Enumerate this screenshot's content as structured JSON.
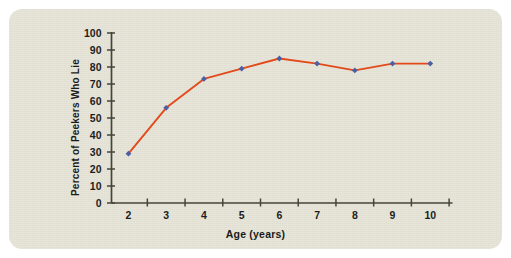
{
  "figure": {
    "background_color": "#e7e5d8",
    "page_color": "#ffffff"
  },
  "chart_data": {
    "type": "line",
    "title": "",
    "xlabel": "Age (years)",
    "ylabel": "Percent of Peekers Who Lie",
    "x": [
      2,
      3,
      4,
      5,
      6,
      7,
      8,
      9,
      10
    ],
    "values": [
      29,
      56,
      73,
      79,
      85,
      82,
      78,
      82,
      82
    ],
    "categories": [
      "2",
      "3",
      "4",
      "5",
      "6",
      "7",
      "8",
      "9",
      "10"
    ],
    "xlim": [
      1.55,
      10.55
    ],
    "ylim": [
      0,
      100
    ],
    "y_ticks": [
      0,
      10,
      20,
      30,
      40,
      50,
      60,
      70,
      80,
      90,
      100
    ],
    "y_tick_labels": [
      "0",
      "10",
      "20",
      "30",
      "40",
      "50",
      "60",
      "70",
      "80",
      "90",
      "100"
    ],
    "x_ticks": [
      2.5,
      3.5,
      4.5,
      5.5,
      6.5,
      7.5,
      8.5,
      9.5,
      10.5
    ],
    "x_tick_labels": [
      "2",
      "3",
      "4",
      "5",
      "6",
      "7",
      "8",
      "9",
      "10"
    ],
    "grid": false,
    "legend": null,
    "line_color": "#e24a1b",
    "marker_color": "#4a5fa5",
    "marker_shape": "diamond",
    "axis_color": "#45453d"
  }
}
